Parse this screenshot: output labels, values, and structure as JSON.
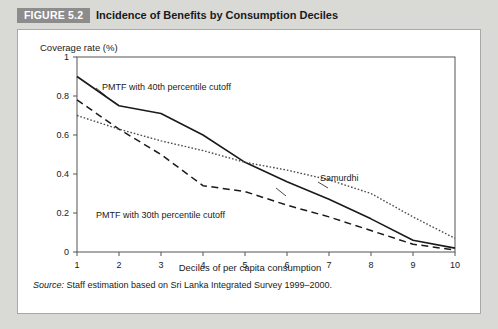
{
  "header": {
    "badge": "FIGURE 5.2",
    "title": "Incidence of Benefits by Consumption Deciles",
    "badge_bg": "#8c8c8c",
    "strip_bg": "#d9d9d6"
  },
  "footer": {
    "source_word": "Source:",
    "source_text": " Staff estimation based on Sri Lanka Integrated Survey 1999–2000."
  },
  "annotations": {
    "pmtf40": "PMTF with 40th percentile cutoff",
    "pmtf30": "PMTF with 30th percentile cutoff",
    "samurdhi": "Samurdhi"
  },
  "chart_data": {
    "type": "line",
    "title": "Incidence of Benefits by Consumption Deciles",
    "subtitle": "",
    "xlabel": "Deciles of per capita consumption",
    "ylabel": "Coverage rate (%)",
    "ylabel_position": "top-left",
    "grid": false,
    "legend": "inline-annotations",
    "x": [
      1,
      2,
      3,
      4,
      5,
      6,
      7,
      8,
      9,
      10
    ],
    "xlim": [
      1,
      10
    ],
    "ylim": [
      0,
      1
    ],
    "xticks": [
      "1",
      "2",
      "3",
      "4",
      "5",
      "6",
      "7",
      "8",
      "9",
      "10"
    ],
    "yticks": [
      "0",
      "0.2",
      "0.4",
      "0.6",
      "0.8",
      "1"
    ],
    "ytick_values": [
      0,
      0.2,
      0.4,
      0.6,
      0.8,
      1
    ],
    "series": [
      {
        "name": "PMTF with 40th percentile cutoff",
        "style": "solid",
        "color": "#1a1a1a",
        "values": [
          0.9,
          0.75,
          0.71,
          0.6,
          0.46,
          0.36,
          0.27,
          0.17,
          0.06,
          0.02
        ]
      },
      {
        "name": "PMTF with 30th percentile cutoff",
        "style": "dashed",
        "color": "#1a1a1a",
        "values": [
          0.78,
          0.63,
          0.5,
          0.34,
          0.31,
          0.24,
          0.18,
          0.11,
          0.04,
          0.01
        ]
      },
      {
        "name": "Samurdhi",
        "style": "dotted",
        "color": "#4d4d4d",
        "values": [
          0.7,
          0.63,
          0.57,
          0.52,
          0.46,
          0.42,
          0.37,
          0.3,
          0.18,
          0.07
        ]
      }
    ]
  }
}
